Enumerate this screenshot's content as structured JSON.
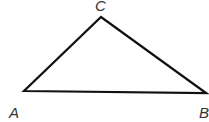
{
  "diagram": {
    "type": "triangle",
    "stroke_color": "#111111",
    "vertices": [
      {
        "name": "A",
        "x": 24,
        "y": 91,
        "label_x": 9,
        "label_y": 118
      },
      {
        "name": "B",
        "x": 206,
        "y": 93,
        "label_x": 199,
        "label_y": 118
      },
      {
        "name": "C",
        "x": 101,
        "y": 17,
        "label_x": 95,
        "label_y": 11
      }
    ],
    "labels": {
      "a": "A",
      "b": "B",
      "c": "C"
    }
  }
}
